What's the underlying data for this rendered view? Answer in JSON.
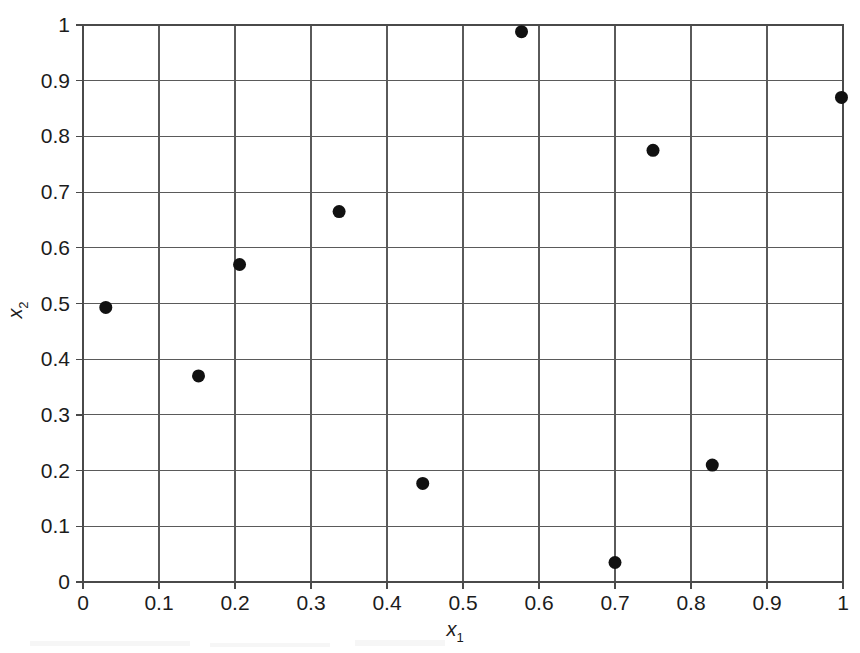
{
  "chart_data": {
    "type": "scatter",
    "title": "",
    "xlabel": "x1",
    "ylabel": "x2",
    "xlabel_base": "x",
    "xlabel_sub": "1",
    "ylabel_base": "x",
    "ylabel_sub": "2",
    "xlim": [
      0,
      1
    ],
    "ylim": [
      0,
      1
    ],
    "grid": true,
    "legend": "none",
    "xticks": [
      0,
      0.1,
      0.2,
      0.3,
      0.4,
      0.5,
      0.6,
      0.7,
      0.8,
      0.9,
      1
    ],
    "yticks": [
      0,
      0.1,
      0.2,
      0.3,
      0.4,
      0.5,
      0.6,
      0.7,
      0.8,
      0.9,
      1
    ],
    "xtick_labels": [
      "0",
      "0.1",
      "0.2",
      "0.3",
      "0.4",
      "0.5",
      "0.6",
      "0.7",
      "0.8",
      "0.9",
      "1"
    ],
    "ytick_labels": [
      "0",
      "0.1",
      "0.2",
      "0.3",
      "0.4",
      "0.5",
      "0.6",
      "0.7",
      "0.8",
      "0.9",
      "1"
    ],
    "marker": "filled-circle",
    "marker_color": "#111111",
    "marker_size_px": 13,
    "points": [
      {
        "x": 0.03,
        "y": 0.493
      },
      {
        "x": 0.152,
        "y": 0.37
      },
      {
        "x": 0.206,
        "y": 0.57
      },
      {
        "x": 0.337,
        "y": 0.665
      },
      {
        "x": 0.447,
        "y": 0.177
      },
      {
        "x": 0.577,
        "y": 0.988
      },
      {
        "x": 0.7,
        "y": 0.035
      },
      {
        "x": 0.75,
        "y": 0.775
      },
      {
        "x": 0.828,
        "y": 0.21
      },
      {
        "x": 0.998,
        "y": 0.87
      }
    ],
    "series": [
      {
        "name": "points",
        "x": [
          0.03,
          0.152,
          0.206,
          0.337,
          0.447,
          0.577,
          0.7,
          0.75,
          0.828,
          0.998
        ],
        "values": [
          0.493,
          0.37,
          0.57,
          0.665,
          0.177,
          0.988,
          0.035,
          0.775,
          0.21,
          0.87
        ]
      }
    ]
  },
  "geometry": {
    "plot_left": 83,
    "plot_right": 843,
    "plot_top": 25,
    "plot_bottom": 582
  }
}
